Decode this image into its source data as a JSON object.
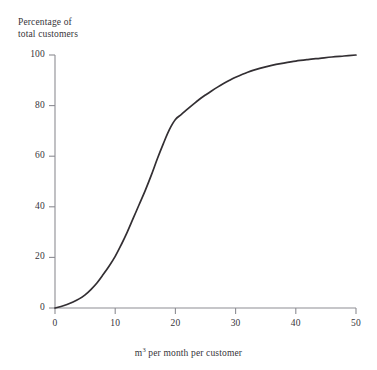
{
  "figure": {
    "title_remnant": "",
    "background_color": "#ffffff",
    "axis_color": "#8d8d93",
    "curve_color": "#332f33",
    "text_color": "#36343a"
  },
  "chart_data": {
    "type": "line",
    "title": "",
    "xlabel": "m³ per month per customer",
    "ylabel_line1": "Percentage of",
    "ylabel_line2": "total customers",
    "ylabel": "Percentage of total customers",
    "xlim": [
      0,
      50
    ],
    "ylim": [
      0,
      100
    ],
    "xticks": [
      0,
      10,
      20,
      30,
      40,
      50
    ],
    "yticks": [
      0,
      20,
      40,
      60,
      80,
      100
    ],
    "xtick_labels": [
      "0",
      "10",
      "20",
      "30",
      "40",
      "50"
    ],
    "ytick_labels": [
      "0",
      "20",
      "40",
      "60",
      "80",
      "100"
    ],
    "grid": false,
    "legend": null,
    "series": [
      {
        "name": "Cumulative percentage of total customers",
        "x": [
          0,
          1,
          2,
          3,
          4,
          5,
          6,
          7,
          8,
          9,
          10,
          11,
          12,
          13,
          14,
          15,
          16,
          17,
          18,
          19,
          20,
          21,
          22,
          23,
          24,
          25,
          26,
          27,
          28,
          29,
          30,
          32,
          34,
          36,
          38,
          40,
          42,
          44,
          46,
          48,
          50
        ],
        "y": [
          0,
          0.6,
          1.4,
          2.4,
          3.6,
          5.2,
          7.4,
          10.0,
          13.2,
          16.6,
          20.4,
          25.0,
          30.0,
          35.5,
          41.0,
          46.5,
          52.5,
          59.0,
          65.0,
          70.5,
          74.5,
          76.5,
          78.6,
          80.6,
          82.5,
          84.2,
          85.8,
          87.3,
          88.7,
          90.0,
          91.2,
          93.2,
          94.7,
          95.9,
          96.8,
          97.6,
          98.2,
          98.7,
          99.2,
          99.6,
          100.0
        ]
      }
    ]
  }
}
